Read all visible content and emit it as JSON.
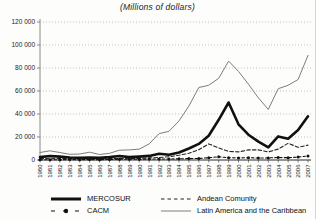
{
  "chart_data": {
    "type": "line",
    "title": "(Millions of dollars)",
    "xlabel": "",
    "ylabel": "",
    "ylim": [
      0,
      120000
    ],
    "grid": "horizontal-dotted",
    "legend_position": "bottom",
    "x": [
      1980,
      1981,
      1982,
      1983,
      1984,
      1985,
      1986,
      1987,
      1988,
      1989,
      1990,
      1991,
      1992,
      1993,
      1994,
      1995,
      1996,
      1997,
      1998,
      1999,
      2000,
      2001,
      2002,
      2003,
      2004,
      2005,
      2006,
      2007
    ],
    "y_ticks": {
      "values": [
        0,
        20000,
        40000,
        60000,
        80000,
        100000,
        120000
      ],
      "labels": [
        "0",
        "20 000",
        "40 000",
        "60 000",
        "80 000",
        "100 000",
        "120 000"
      ]
    },
    "series": [
      {
        "name": "Latin America and the Caribbean",
        "style": "thin-solid",
        "color": "#7c7c7c",
        "values": [
          6500,
          8000,
          6500,
          5000,
          5200,
          6800,
          4800,
          5800,
          8500,
          8800,
          9500,
          14000,
          23000,
          25000,
          34000,
          47000,
          63000,
          65000,
          71000,
          86000,
          77000,
          66000,
          54000,
          44000,
          62000,
          65000,
          70000,
          91000
        ]
      },
      {
        "name": "Andean Comunity",
        "style": "dashed",
        "color": "#222222",
        "values": [
          1200,
          1500,
          1400,
          1200,
          1000,
          1200,
          1000,
          1200,
          1400,
          1500,
          1300,
          1800,
          2200,
          2800,
          4200,
          5800,
          9000,
          14000,
          10500,
          7500,
          7000,
          8800,
          8800,
          7000,
          9500,
          14500,
          11000,
          13000
        ]
      },
      {
        "name": "CACM",
        "style": "dash-dot-marker",
        "color": "#111111",
        "values": [
          200,
          250,
          300,
          350,
          300,
          350,
          300,
          500,
          600,
          600,
          700,
          800,
          900,
          900,
          1000,
          1200,
          1300,
          2000,
          2800,
          2000,
          1800,
          2000,
          1700,
          1800,
          2200,
          2000,
          2500,
          3500
        ]
      },
      {
        "name": "MERCOSUR",
        "style": "thick-solid",
        "color": "#111111",
        "values": [
          2500,
          3500,
          3000,
          2200,
          2000,
          2200,
          1800,
          2500,
          3500,
          2500,
          3000,
          3600,
          5500,
          4500,
          6500,
          10000,
          14000,
          21000,
          35000,
          50000,
          31000,
          22000,
          16000,
          11000,
          20500,
          18500,
          26000,
          38000
        ]
      }
    ],
    "legend": [
      {
        "label": "MERCOSUR",
        "swatch": "thick-solid"
      },
      {
        "label": "Andean Comunity",
        "swatch": "dashed"
      },
      {
        "label": "CACM",
        "swatch": "dash-dot-marker"
      },
      {
        "label": "Latin America and the Caribbean",
        "swatch": "thin-solid"
      }
    ],
    "colors": {
      "grid": "#b3b3b3",
      "axis": "#2b2b2b",
      "y_axis": "#8a8a8a",
      "text": "#1a1a1a"
    }
  }
}
